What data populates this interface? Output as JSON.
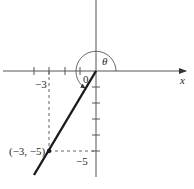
{
  "diagram": {
    "type": "coordinate-plane-angle",
    "origin_px": [
      96,
      71
    ],
    "unit_px": 16,
    "axes": {
      "x_label": "x",
      "x_tick_labels": [
        {
          "value": -3,
          "text": "−3"
        }
      ],
      "y_tick_labels": [
        {
          "value": -5,
          "text": "−5"
        }
      ]
    },
    "point": {
      "label": "(−3, −5)",
      "x": -3,
      "y": -5
    },
    "origin_label": "0",
    "angle_label": "θ",
    "colors": {
      "line": "#1a1a1a",
      "axis": "#555555",
      "dashed": "#666666"
    }
  }
}
